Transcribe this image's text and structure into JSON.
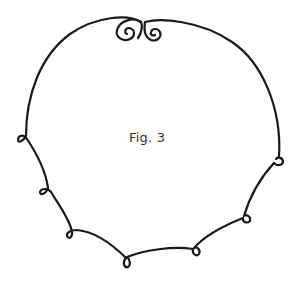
{
  "figure": {
    "caption": "Fig. 3",
    "colors": {
      "stroke": "#1a1a1a",
      "background": "#ffffff",
      "caption": "#333333"
    },
    "ornaments": {
      "top_scroll": "double-spiral",
      "loop_count": 7
    }
  }
}
